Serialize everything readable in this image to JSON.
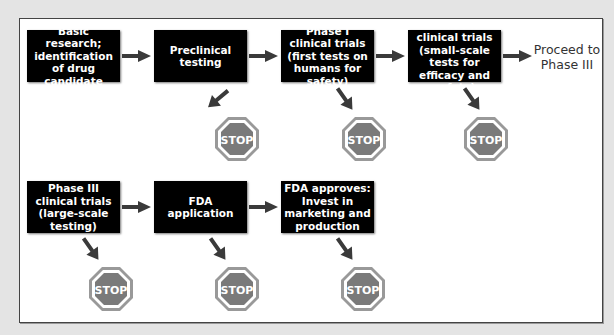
{
  "diagram": {
    "row1": {
      "steps": [
        {
          "id": "basic-research",
          "label": "Basic research; identification of drug candidate",
          "stop": false
        },
        {
          "id": "preclinical",
          "label": "Preclinical testing",
          "stop": true
        },
        {
          "id": "phase1",
          "label": "Phase I clinical trials (first tests on humans for safety)",
          "stop": true
        },
        {
          "id": "phase2",
          "label": "Phase II clinical trials (small-scale tests for efficacy and safety)",
          "stop": true
        }
      ],
      "end_note": "Proceed to Phase III"
    },
    "row2": {
      "steps": [
        {
          "id": "phase3",
          "label": "Phase III clinical trials (large-scale testing)",
          "stop": true
        },
        {
          "id": "fda-application",
          "label": "FDA application",
          "stop": true
        },
        {
          "id": "fda-approves",
          "label": "FDA approves: Invest in marketing and production",
          "stop": true
        }
      ]
    },
    "stop_label": "STOP",
    "colors": {
      "box_fill": "#000000",
      "box_text": "#ffffff",
      "arrow": "#3a3a3a",
      "stop_fill": "#7a7a7a",
      "stop_ring": "#ffffff",
      "stop_border": "#8a8a8a",
      "background": "#e4e4e4",
      "panel": "#ffffff"
    }
  }
}
